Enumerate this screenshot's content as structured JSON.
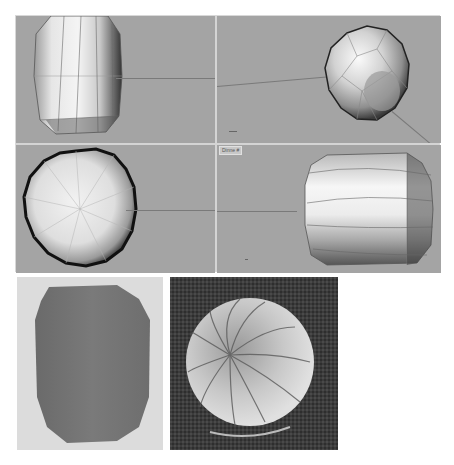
{
  "figure": {
    "viewports": [
      {
        "name": "front",
        "shape": "barrel-upright"
      },
      {
        "name": "perspective",
        "shape": "faceted-sphere"
      },
      {
        "name": "top",
        "shape": "polygon-disc"
      },
      {
        "name": "right",
        "shape": "barrel-sideways",
        "label": "Dinne #"
      }
    ],
    "bottom_panels": [
      {
        "name": "shaded-render",
        "description": "Flat shaded barrel silhouette"
      },
      {
        "name": "sem-micrograph",
        "description": "Ribbed spherical egg on textured surface"
      }
    ]
  }
}
